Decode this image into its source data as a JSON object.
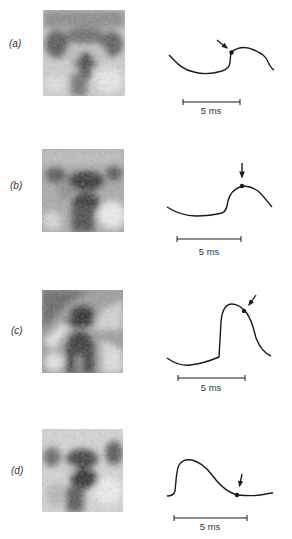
{
  "figure": {
    "panels": [
      {
        "id": "a",
        "label": "(a)",
        "scale_bar_label": "5 ms",
        "description": "scan image with trace; arrow marks dot just after upstroke"
      },
      {
        "id": "b",
        "label": "(b)",
        "scale_bar_label": "5 ms",
        "description": "scan image with trace; arrow marks dot at peak"
      },
      {
        "id": "c",
        "label": "(c)",
        "scale_bar_label": "5 ms",
        "description": "scan image with trace; arrow marks dot on descending limb"
      },
      {
        "id": "d",
        "label": "(d)",
        "scale_bar_label": "5 ms",
        "description": "scan image with trace; arrow marks dot near baseline after decay"
      }
    ],
    "colors": {
      "ink": "#1a1a1a",
      "text": "#333333",
      "background": "#ffffff"
    }
  }
}
